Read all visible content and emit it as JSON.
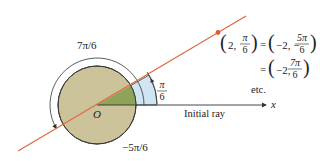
{
  "figure": {
    "origin_label": "O",
    "angle_positive_label": "7π/6",
    "angle_negative_label": "−5π/6",
    "angle_small_num": "π",
    "angle_small_den": "6",
    "initial_ray_label": "Initial ray",
    "x_axis_label": "x"
  },
  "equations": {
    "line1": {
      "left_r": "2,",
      "left_theta_num": "π",
      "left_theta_den": "6",
      "equals": "=",
      "right_r": "−2, −",
      "right_theta_num": "5π",
      "right_theta_den": "6"
    },
    "line2": {
      "equals": "=",
      "right_r": "−2,",
      "right_theta_num": "7π",
      "right_theta_den": "6"
    },
    "etc": "etc."
  },
  "colors": {
    "disk_fill": "#cdc39b",
    "disk_stroke": "#3a3a3a",
    "sector_green": "#8fa25a",
    "sector_blue": "#cfe5f2",
    "line_orange": "#e06a45",
    "point_orange": "#e0583a",
    "arc_stroke": "#333333",
    "axis_stroke": "#333333"
  }
}
